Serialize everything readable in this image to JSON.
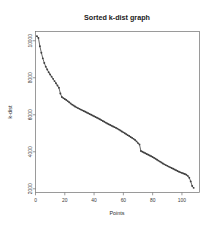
{
  "chart_data": {
    "type": "scatter",
    "title": "Sorted k-dist graph",
    "xlabel": "Points",
    "ylabel": "k-dist",
    "xlim": [
      0,
      112
    ],
    "ylim": [
      1800,
      10500
    ],
    "xticks": [
      0,
      20,
      40,
      60,
      80,
      100
    ],
    "xticklabels": [
      "0",
      "20",
      "40",
      "60",
      "80",
      "100"
    ],
    "yticks": [
      2000,
      4000,
      6000,
      8000,
      10000
    ],
    "yticklabels": [
      "2000",
      "4000",
      "6000",
      "8000",
      "10000"
    ],
    "grid": false,
    "legend": false,
    "marker": "point",
    "line_color": "#4a4a4a",
    "point_color": "#3f3f3f",
    "series": [
      {
        "name": "k-dist",
        "x": [
          1,
          2,
          3,
          4,
          5,
          6,
          7,
          8,
          9,
          10,
          11,
          12,
          13,
          14,
          15,
          16,
          17,
          18,
          19,
          20,
          21,
          22,
          23,
          24,
          25,
          26,
          27,
          28,
          29,
          30,
          31,
          32,
          33,
          34,
          35,
          36,
          37,
          38,
          39,
          40,
          41,
          42,
          43,
          44,
          45,
          46,
          47,
          48,
          49,
          50,
          51,
          52,
          53,
          54,
          55,
          56,
          57,
          58,
          59,
          60,
          61,
          62,
          63,
          64,
          65,
          66,
          67,
          68,
          69,
          70,
          71,
          72,
          73,
          74,
          75,
          76,
          77,
          78,
          79,
          80,
          81,
          82,
          83,
          84,
          85,
          86,
          87,
          88,
          89,
          90,
          91,
          92,
          93,
          94,
          95,
          96,
          97,
          98,
          99,
          100,
          101,
          102,
          103,
          104,
          105,
          106,
          107,
          108
        ],
        "y": [
          10250,
          10150,
          9700,
          9350,
          9050,
          8800,
          8600,
          8450,
          8300,
          8180,
          8060,
          7940,
          7820,
          7700,
          7580,
          7460,
          7150,
          6960,
          6900,
          6850,
          6800,
          6740,
          6680,
          6610,
          6550,
          6500,
          6450,
          6400,
          6360,
          6320,
          6280,
          6240,
          6200,
          6160,
          6120,
          6080,
          6040,
          6000,
          5960,
          5920,
          5880,
          5840,
          5800,
          5755,
          5710,
          5665,
          5620,
          5575,
          5530,
          5490,
          5450,
          5410,
          5370,
          5330,
          5290,
          5250,
          5200,
          5150,
          5100,
          5050,
          5000,
          4950,
          4900,
          4850,
          4800,
          4750,
          4700,
          4640,
          4560,
          4470,
          4400,
          4040,
          4000,
          3960,
          3920,
          3880,
          3840,
          3800,
          3760,
          3720,
          3670,
          3620,
          3570,
          3520,
          3470,
          3420,
          3370,
          3320,
          3280,
          3240,
          3200,
          3160,
          3120,
          3080,
          3040,
          3000,
          2960,
          2920,
          2890,
          2860,
          2830,
          2800,
          2760,
          2700,
          2600,
          2400,
          2150,
          2050
        ]
      }
    ]
  },
  "figure": {
    "background_color": "#ffffff",
    "title_color": "#1a1a1a",
    "axis_color": "#6f6f6f"
  }
}
